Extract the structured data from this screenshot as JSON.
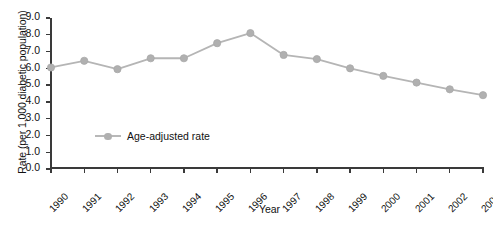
{
  "chart_data": {
    "type": "line",
    "title": "",
    "xlabel": "Year",
    "ylabel": "Rate (per 1,000 diabetic population)",
    "categories": [
      "1990",
      "1991",
      "1992",
      "1993",
      "1994",
      "1995",
      "1996",
      "1997",
      "1998",
      "1999",
      "2000",
      "2001",
      "2002",
      "2003"
    ],
    "series": [
      {
        "name": "Age-adjusted rate",
        "values": [
          6.05,
          6.45,
          5.95,
          6.6,
          6.6,
          7.5,
          8.1,
          6.8,
          6.55,
          6.0,
          5.55,
          5.15,
          4.75,
          4.4
        ],
        "color": "#b5b5b5",
        "marker": "circle"
      }
    ],
    "ylim": [
      0.0,
      9.0
    ],
    "ytick_labels": [
      "9.0",
      "8.0",
      "7.0",
      "6.0",
      "5.0",
      "4.0",
      "3.0",
      "2.0",
      "1.0",
      "0.0"
    ],
    "ytick_values": [
      9.0,
      8.0,
      7.0,
      6.0,
      5.0,
      4.0,
      3.0,
      2.0,
      1.0,
      0.0
    ],
    "grid": false,
    "legend_position": "inside-lower-left",
    "legend_entries": [
      "Age-adjusted rate"
    ]
  },
  "axis": {
    "y_title": "Rate (per 1,000 diabetic population)",
    "x_title": "Year"
  },
  "legend": {
    "entry_label": "Age-adjusted rate"
  }
}
